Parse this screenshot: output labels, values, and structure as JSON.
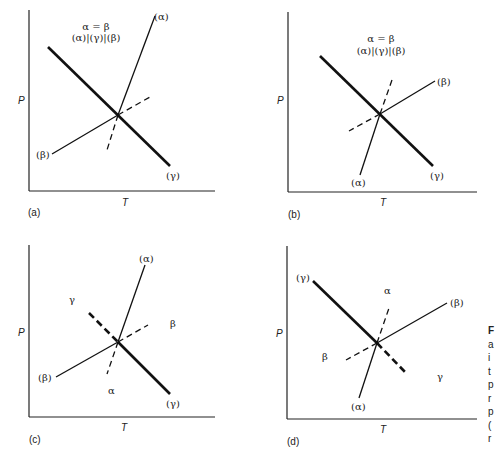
{
  "figure": {
    "panels": [
      {
        "id": "a",
        "label": "(a)",
        "x_axis": "T",
        "y_axis": "P",
        "annotation_top": "α = β",
        "annotation_bottom": "(α)|(γ)|(β)",
        "curve_labels": {
          "alpha": "(α)",
          "beta": "(β)",
          "gamma": "(γ)"
        },
        "region_labels": {}
      },
      {
        "id": "b",
        "label": "(b)",
        "x_axis": "T",
        "y_axis": "P",
        "annotation_top": "α = β",
        "annotation_bottom": "(α)|(γ)|(β)",
        "curve_labels": {
          "alpha": "(α)",
          "beta": "(β)",
          "gamma": "(γ)"
        },
        "region_labels": {}
      },
      {
        "id": "c",
        "label": "(c)",
        "x_axis": "T",
        "y_axis": "P",
        "curve_labels": {
          "alpha": "(α)",
          "beta": "(β)",
          "gamma": "(γ)"
        },
        "region_labels": {
          "gamma": "γ",
          "beta": "β",
          "alpha": "α"
        }
      },
      {
        "id": "d",
        "label": "(d)",
        "x_axis": "T",
        "y_axis": "P",
        "curve_labels": {
          "alpha": "(α)",
          "beta": "(β)",
          "gamma": "(γ)"
        },
        "region_labels": {
          "alpha": "α",
          "beta": "β",
          "gamma": "γ"
        }
      }
    ],
    "side_caption_fragment": [
      "F",
      "a",
      "i",
      "t",
      "p",
      "r",
      "p",
      "(",
      "r"
    ]
  }
}
